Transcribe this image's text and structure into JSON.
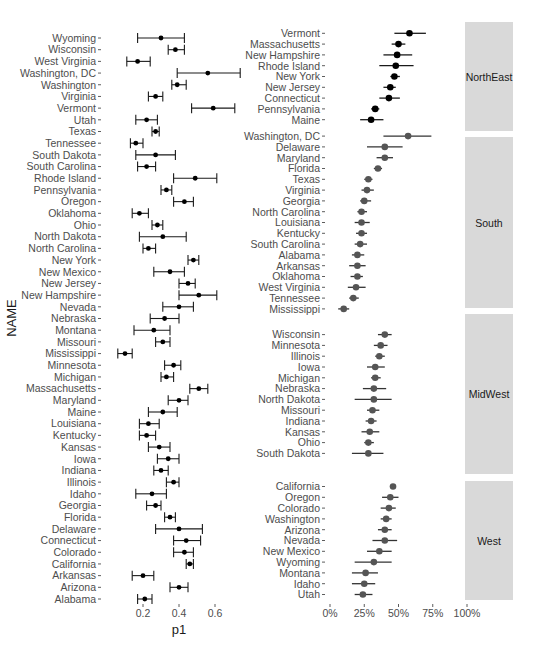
{
  "chart_data": [
    {
      "type": "errorbar",
      "title": "",
      "xlabel": "p1",
      "ylabel": "NAME",
      "xlim": [
        0.05,
        0.75
      ],
      "xticks": [
        0.2,
        0.4,
        0.6
      ],
      "xtick_labels": [
        "0.2",
        "0.4",
        "0.6"
      ],
      "grid": false,
      "rows": [
        {
          "name": "Wyoming",
          "p": 0.3,
          "lo": 0.17,
          "hi": 0.43
        },
        {
          "name": "Wisconsin",
          "p": 0.38,
          "lo": 0.34,
          "hi": 0.43
        },
        {
          "name": "West Virginia",
          "p": 0.17,
          "lo": 0.11,
          "hi": 0.24
        },
        {
          "name": "Washington, DC",
          "p": 0.56,
          "lo": 0.39,
          "hi": 0.74
        },
        {
          "name": "Washington",
          "p": 0.39,
          "lo": 0.36,
          "hi": 0.44
        },
        {
          "name": "Virginia",
          "p": 0.27,
          "lo": 0.23,
          "hi": 0.31
        },
        {
          "name": "Vermont",
          "p": 0.59,
          "lo": 0.47,
          "hi": 0.71
        },
        {
          "name": "Utah",
          "p": 0.22,
          "lo": 0.16,
          "hi": 0.28
        },
        {
          "name": "Texas",
          "p": 0.27,
          "lo": 0.25,
          "hi": 0.29
        },
        {
          "name": "Tennessee",
          "p": 0.16,
          "lo": 0.13,
          "hi": 0.2
        },
        {
          "name": "South Dakota",
          "p": 0.27,
          "lo": 0.16,
          "hi": 0.38
        },
        {
          "name": "South Carolina",
          "p": 0.22,
          "lo": 0.17,
          "hi": 0.27
        },
        {
          "name": "Rhode Island",
          "p": 0.49,
          "lo": 0.37,
          "hi": 0.61
        },
        {
          "name": "Pennsylvania",
          "p": 0.33,
          "lo": 0.3,
          "hi": 0.36
        },
        {
          "name": "Oregon",
          "p": 0.43,
          "lo": 0.37,
          "hi": 0.48
        },
        {
          "name": "Oklahoma",
          "p": 0.18,
          "lo": 0.14,
          "hi": 0.23
        },
        {
          "name": "Ohio",
          "p": 0.28,
          "lo": 0.25,
          "hi": 0.31
        },
        {
          "name": "North Dakota",
          "p": 0.31,
          "lo": 0.18,
          "hi": 0.44
        },
        {
          "name": "North Carolina",
          "p": 0.23,
          "lo": 0.2,
          "hi": 0.27
        },
        {
          "name": "New York",
          "p": 0.48,
          "lo": 0.45,
          "hi": 0.51
        },
        {
          "name": "New Mexico",
          "p": 0.35,
          "lo": 0.26,
          "hi": 0.43
        },
        {
          "name": "New Jersey",
          "p": 0.45,
          "lo": 0.4,
          "hi": 0.49
        },
        {
          "name": "New Hampshire",
          "p": 0.51,
          "lo": 0.4,
          "hi": 0.61
        },
        {
          "name": "Nevada",
          "p": 0.4,
          "lo": 0.31,
          "hi": 0.48
        },
        {
          "name": "Nebraska",
          "p": 0.32,
          "lo": 0.24,
          "hi": 0.4
        },
        {
          "name": "Montana",
          "p": 0.26,
          "lo": 0.15,
          "hi": 0.35
        },
        {
          "name": "Missouri",
          "p": 0.31,
          "lo": 0.27,
          "hi": 0.35
        },
        {
          "name": "Mississippi",
          "p": 0.1,
          "lo": 0.06,
          "hi": 0.14
        },
        {
          "name": "Minnesota",
          "p": 0.37,
          "lo": 0.32,
          "hi": 0.41
        },
        {
          "name": "Michigan",
          "p": 0.33,
          "lo": 0.3,
          "hi": 0.37
        },
        {
          "name": "Massachusetts",
          "p": 0.51,
          "lo": 0.46,
          "hi": 0.56
        },
        {
          "name": "Maryland",
          "p": 0.4,
          "lo": 0.34,
          "hi": 0.45
        },
        {
          "name": "Maine",
          "p": 0.31,
          "lo": 0.23,
          "hi": 0.39
        },
        {
          "name": "Louisiana",
          "p": 0.23,
          "lo": 0.18,
          "hi": 0.29
        },
        {
          "name": "Kentucky",
          "p": 0.22,
          "lo": 0.18,
          "hi": 0.27
        },
        {
          "name": "Kansas",
          "p": 0.29,
          "lo": 0.23,
          "hi": 0.35
        },
        {
          "name": "Iowa",
          "p": 0.34,
          "lo": 0.28,
          "hi": 0.4
        },
        {
          "name": "Indiana",
          "p": 0.3,
          "lo": 0.26,
          "hi": 0.34
        },
        {
          "name": "Illinois",
          "p": 0.37,
          "lo": 0.33,
          "hi": 0.4
        },
        {
          "name": "Idaho",
          "p": 0.25,
          "lo": 0.16,
          "hi": 0.33
        },
        {
          "name": "Georgia",
          "p": 0.27,
          "lo": 0.22,
          "hi": 0.3
        },
        {
          "name": "Florida",
          "p": 0.35,
          "lo": 0.32,
          "hi": 0.38
        },
        {
          "name": "Delaware",
          "p": 0.4,
          "lo": 0.27,
          "hi": 0.53
        },
        {
          "name": "Connecticut",
          "p": 0.44,
          "lo": 0.37,
          "hi": 0.52
        },
        {
          "name": "Colorado",
          "p": 0.43,
          "lo": 0.37,
          "hi": 0.48
        },
        {
          "name": "California",
          "p": 0.46,
          "lo": 0.44,
          "hi": 0.48
        },
        {
          "name": "Arkansas",
          "p": 0.2,
          "lo": 0.14,
          "hi": 0.26
        },
        {
          "name": "Arizona",
          "p": 0.4,
          "lo": 0.35,
          "hi": 0.45
        },
        {
          "name": "Alabama",
          "p": 0.21,
          "lo": 0.17,
          "hi": 0.25
        }
      ]
    },
    {
      "type": "errorbar_faceted",
      "title": "",
      "xlabel": "",
      "ylabel": "",
      "xlim": [
        0,
        1
      ],
      "xticks": [
        0,
        0.25,
        0.5,
        0.75,
        1.0
      ],
      "xtick_labels": [
        "0%",
        "25%",
        "50%",
        "75%",
        "100%"
      ],
      "grid": false,
      "facets": [
        {
          "label": "NorthEast",
          "rows": [
            {
              "name": "Vermont",
              "p": 0.58,
              "lo": 0.47,
              "hi": 0.7
            },
            {
              "name": "Massachusetts",
              "p": 0.5,
              "lo": 0.45,
              "hi": 0.55
            },
            {
              "name": "New Hampshire",
              "p": 0.49,
              "lo": 0.39,
              "hi": 0.6
            },
            {
              "name": "Rhode Island",
              "p": 0.48,
              "lo": 0.36,
              "hi": 0.61
            },
            {
              "name": "New York",
              "p": 0.47,
              "lo": 0.44,
              "hi": 0.51
            },
            {
              "name": "New Jersey",
              "p": 0.44,
              "lo": 0.39,
              "hi": 0.48
            },
            {
              "name": "Connecticut",
              "p": 0.43,
              "lo": 0.36,
              "hi": 0.51
            },
            {
              "name": "Pennsylvania",
              "p": 0.33,
              "lo": 0.3,
              "hi": 0.36
            },
            {
              "name": "Maine",
              "p": 0.3,
              "lo": 0.22,
              "hi": 0.39
            }
          ]
        },
        {
          "label": "South",
          "rows": [
            {
              "name": "Washington, DC",
              "p": 0.57,
              "lo": 0.39,
              "hi": 0.74
            },
            {
              "name": "Delaware",
              "p": 0.4,
              "lo": 0.27,
              "hi": 0.53
            },
            {
              "name": "Maryland",
              "p": 0.4,
              "lo": 0.34,
              "hi": 0.46
            },
            {
              "name": "Florida",
              "p": 0.35,
              "lo": 0.32,
              "hi": 0.38
            },
            {
              "name": "Texas",
              "p": 0.28,
              "lo": 0.25,
              "hi": 0.31
            },
            {
              "name": "Virginia",
              "p": 0.27,
              "lo": 0.23,
              "hi": 0.32
            },
            {
              "name": "Georgia",
              "p": 0.25,
              "lo": 0.22,
              "hi": 0.3
            },
            {
              "name": "North Carolina",
              "p": 0.23,
              "lo": 0.2,
              "hi": 0.27
            },
            {
              "name": "Louisiana",
              "p": 0.23,
              "lo": 0.18,
              "hi": 0.29
            },
            {
              "name": "Kentucky",
              "p": 0.23,
              "lo": 0.19,
              "hi": 0.27
            },
            {
              "name": "South Carolina",
              "p": 0.22,
              "lo": 0.18,
              "hi": 0.27
            },
            {
              "name": "Alabama",
              "p": 0.2,
              "lo": 0.16,
              "hi": 0.25
            },
            {
              "name": "Arkansas",
              "p": 0.2,
              "lo": 0.14,
              "hi": 0.26
            },
            {
              "name": "Oklahoma",
              "p": 0.2,
              "lo": 0.15,
              "hi": 0.24
            },
            {
              "name": "West Virginia",
              "p": 0.19,
              "lo": 0.13,
              "hi": 0.26
            },
            {
              "name": "Tennessee",
              "p": 0.17,
              "lo": 0.14,
              "hi": 0.21
            },
            {
              "name": "Mississippi",
              "p": 0.1,
              "lo": 0.06,
              "hi": 0.14
            }
          ]
        },
        {
          "label": "MidWest",
          "rows": [
            {
              "name": "Wisconsin",
              "p": 0.4,
              "lo": 0.35,
              "hi": 0.45
            },
            {
              "name": "Minnesota",
              "p": 0.37,
              "lo": 0.32,
              "hi": 0.42
            },
            {
              "name": "Illinois",
              "p": 0.36,
              "lo": 0.33,
              "hi": 0.4
            },
            {
              "name": "Iowa",
              "p": 0.33,
              "lo": 0.27,
              "hi": 0.4
            },
            {
              "name": "Michigan",
              "p": 0.33,
              "lo": 0.3,
              "hi": 0.37
            },
            {
              "name": "Nebraska",
              "p": 0.32,
              "lo": 0.24,
              "hi": 0.41
            },
            {
              "name": "North Dakota",
              "p": 0.32,
              "lo": 0.18,
              "hi": 0.45
            },
            {
              "name": "Missouri",
              "p": 0.31,
              "lo": 0.27,
              "hi": 0.36
            },
            {
              "name": "Indiana",
              "p": 0.3,
              "lo": 0.26,
              "hi": 0.34
            },
            {
              "name": "Kansas",
              "p": 0.29,
              "lo": 0.23,
              "hi": 0.36
            },
            {
              "name": "Ohio",
              "p": 0.28,
              "lo": 0.25,
              "hi": 0.32
            },
            {
              "name": "South Dakota",
              "p": 0.28,
              "lo": 0.16,
              "hi": 0.39
            }
          ]
        },
        {
          "label": "West",
          "rows": [
            {
              "name": "California",
              "p": 0.46,
              "lo": 0.44,
              "hi": 0.48
            },
            {
              "name": "Oregon",
              "p": 0.44,
              "lo": 0.38,
              "hi": 0.5
            },
            {
              "name": "Colorado",
              "p": 0.43,
              "lo": 0.37,
              "hi": 0.48
            },
            {
              "name": "Washington",
              "p": 0.41,
              "lo": 0.37,
              "hi": 0.45
            },
            {
              "name": "Arizona",
              "p": 0.4,
              "lo": 0.35,
              "hi": 0.45
            },
            {
              "name": "Nevada",
              "p": 0.4,
              "lo": 0.31,
              "hi": 0.49
            },
            {
              "name": "New Mexico",
              "p": 0.36,
              "lo": 0.27,
              "hi": 0.45
            },
            {
              "name": "Wyoming",
              "p": 0.32,
              "lo": 0.18,
              "hi": 0.45
            },
            {
              "name": "Montana",
              "p": 0.26,
              "lo": 0.16,
              "hi": 0.35
            },
            {
              "name": "Idaho",
              "p": 0.25,
              "lo": 0.16,
              "hi": 0.33
            },
            {
              "name": "Utah",
              "p": 0.24,
              "lo": 0.18,
              "hi": 0.31
            }
          ]
        }
      ]
    }
  ],
  "colors": {
    "point": "#000000",
    "errorbar": "#1a1a1a",
    "strip_bg": "#d9d9d9",
    "panel_bg": "#ebebeb",
    "text": "#4d4d4d"
  }
}
